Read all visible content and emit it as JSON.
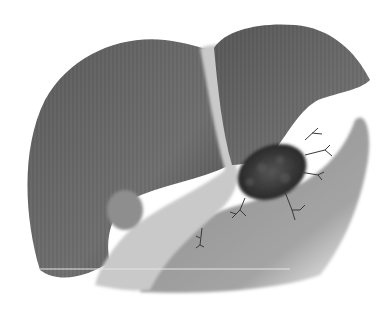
{
  "image": {
    "subject": "liver illustration with tumor",
    "style": "grayscale airbrushed medical illustration",
    "background": "#ffffff",
    "colors": {
      "right_lobe": "#6b6b6b",
      "left_lobe": "#707070",
      "ligament": "#c8c8c8",
      "underside": "#9a9a9a",
      "gallbladder": "#8a8a8a",
      "tumor": "#2e2e2e",
      "vessels": "#3a3a3a"
    }
  }
}
